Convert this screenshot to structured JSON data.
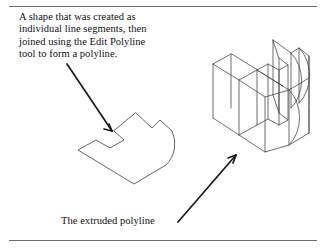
{
  "figure": {
    "caption": {
      "lines": [
        "A shape that was created as",
        "individual line segments, then",
        "joined using the Edit Polyline",
        "tool to form a polyline."
      ]
    },
    "bottom_label": "The extruded polyline",
    "rules": {
      "top_present": "",
      "bottom_present": ""
    },
    "colors": {
      "rule": "#6d6d6d",
      "text": "#111111",
      "wireframe": "#4a4a4a",
      "profile": "#555555",
      "leader": "#1a1a1a",
      "background": "#ffffff"
    },
    "drawings": {
      "profile_name": "2d-polyline-profile",
      "solid_name": "3d-extruded-solid",
      "leader_top_name": "leader-line-to-profile",
      "leader_bottom_name": "leader-line-to-solid"
    }
  }
}
